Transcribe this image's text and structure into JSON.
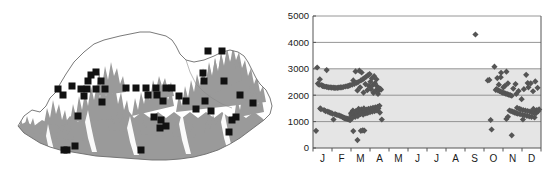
{
  "figure": {
    "panels": [
      "distribution-map",
      "elevation-by-month-scatter"
    ]
  },
  "map": {
    "title": "",
    "region_name": "Bhutan",
    "outline_color": "#6b6b6b",
    "terrain_fill_color": "#9a9a9a",
    "background_color": "#ffffff",
    "marker_symbol": "filled-square",
    "marker_color": "#111111",
    "marker_count": 62,
    "markers": [
      {
        "x": 101,
        "y": 81
      },
      {
        "x": 91,
        "y": 75
      },
      {
        "x": 72,
        "y": 86
      },
      {
        "x": 63,
        "y": 95
      },
      {
        "x": 58,
        "y": 89
      },
      {
        "x": 87,
        "y": 89
      },
      {
        "x": 88,
        "y": 81
      },
      {
        "x": 96,
        "y": 72
      },
      {
        "x": 105,
        "y": 89
      },
      {
        "x": 96,
        "y": 89
      },
      {
        "x": 81,
        "y": 89
      },
      {
        "x": 84,
        "y": 96
      },
      {
        "x": 102,
        "y": 102
      },
      {
        "x": 78,
        "y": 116
      },
      {
        "x": 75,
        "y": 146
      },
      {
        "x": 67,
        "y": 150
      },
      {
        "x": 64,
        "y": 150
      },
      {
        "x": 141,
        "y": 150
      },
      {
        "x": 126,
        "y": 88
      },
      {
        "x": 136,
        "y": 88
      },
      {
        "x": 146,
        "y": 88
      },
      {
        "x": 156,
        "y": 88
      },
      {
        "x": 166,
        "y": 88
      },
      {
        "x": 172,
        "y": 88
      },
      {
        "x": 148,
        "y": 95
      },
      {
        "x": 157,
        "y": 95
      },
      {
        "x": 163,
        "y": 101
      },
      {
        "x": 179,
        "y": 96
      },
      {
        "x": 154,
        "y": 117
      },
      {
        "x": 161,
        "y": 120
      },
      {
        "x": 160,
        "y": 128
      },
      {
        "x": 166,
        "y": 126
      },
      {
        "x": 208,
        "y": 51
      },
      {
        "x": 222,
        "y": 51
      },
      {
        "x": 203,
        "y": 73
      },
      {
        "x": 204,
        "y": 81
      },
      {
        "x": 224,
        "y": 81
      },
      {
        "x": 205,
        "y": 101
      },
      {
        "x": 196,
        "y": 109
      },
      {
        "x": 211,
        "y": 111
      },
      {
        "x": 186,
        "y": 101
      },
      {
        "x": 232,
        "y": 120
      },
      {
        "x": 236,
        "y": 117
      },
      {
        "x": 229,
        "y": 132
      },
      {
        "x": 253,
        "y": 103
      },
      {
        "x": 240,
        "y": 95
      }
    ]
  },
  "chart_data": {
    "type": "scatter",
    "title": "",
    "xlabel": "",
    "ylabel": "",
    "xlim": [
      0,
      12
    ],
    "ylim": [
      0,
      5000
    ],
    "ytick_values": [
      0,
      1000,
      2000,
      3000,
      4000,
      5000
    ],
    "ytick_labels": [
      "0",
      "1000",
      "2000",
      "3000",
      "4000",
      "5000"
    ],
    "xtick_labels": [
      "J",
      "F",
      "M",
      "A",
      "M",
      "J",
      "J",
      "A",
      "S",
      "O",
      "N",
      "D"
    ],
    "xtick_positions": [
      0.5,
      1.5,
      2.5,
      3.5,
      4.5,
      5.5,
      6.5,
      7.5,
      8.5,
      9.5,
      10.5,
      11.5
    ],
    "grid": true,
    "gridline_values": [
      1000,
      2000,
      3000,
      4000,
      5000
    ],
    "gridline_color": "#8a8a8a",
    "shaded_band": {
      "from": 0,
      "to": 3000,
      "fill": "#e8e8e8"
    },
    "marker_symbol": "filled-diamond",
    "marker_color": "#555555",
    "frame_color": "#555555",
    "point_count": 218,
    "points": [
      [
        0.16,
        650
      ],
      [
        0.22,
        3050
      ],
      [
        0.26,
        2440
      ],
      [
        0.3,
        2420
      ],
      [
        0.33,
        2400
      ],
      [
        0.36,
        2600
      ],
      [
        0.38,
        1500
      ],
      [
        0.42,
        1470
      ],
      [
        0.46,
        2380
      ],
      [
        0.5,
        2350
      ],
      [
        0.54,
        2340
      ],
      [
        0.58,
        1440
      ],
      [
        0.62,
        2330
      ],
      [
        0.66,
        1400
      ],
      [
        0.7,
        2320
      ],
      [
        0.72,
        2950
      ],
      [
        0.74,
        2310
      ],
      [
        0.78,
        1380
      ],
      [
        0.82,
        2300
      ],
      [
        0.86,
        1350
      ],
      [
        0.9,
        2300
      ],
      [
        0.94,
        1330
      ],
      [
        0.98,
        2290
      ],
      [
        1.02,
        1300
      ],
      [
        1.06,
        2290
      ],
      [
        1.08,
        1080
      ],
      [
        1.12,
        2280
      ],
      [
        1.16,
        1280
      ],
      [
        1.2,
        2280
      ],
      [
        1.24,
        1260
      ],
      [
        1.28,
        2280
      ],
      [
        1.32,
        1240
      ],
      [
        1.36,
        2290
      ],
      [
        1.4,
        1230
      ],
      [
        1.44,
        2300
      ],
      [
        1.48,
        1200
      ],
      [
        1.52,
        2300
      ],
      [
        1.56,
        1170
      ],
      [
        1.6,
        2310
      ],
      [
        1.62,
        1150
      ],
      [
        1.66,
        1130
      ],
      [
        1.7,
        2330
      ],
      [
        1.72,
        1120
      ],
      [
        1.76,
        1110
      ],
      [
        1.8,
        2340
      ],
      [
        1.82,
        1100
      ],
      [
        1.86,
        1090
      ],
      [
        1.88,
        2350
      ],
      [
        1.9,
        1080
      ],
      [
        1.92,
        1070
      ],
      [
        1.95,
        2380
      ],
      [
        1.97,
        1060
      ],
      [
        2.0,
        1320
      ],
      [
        2.02,
        1250
      ],
      [
        2.04,
        1200
      ],
      [
        2.06,
        2400
      ],
      [
        2.08,
        1150
      ],
      [
        2.1,
        1420
      ],
      [
        2.12,
        2560
      ],
      [
        2.14,
        1350
      ],
      [
        2.16,
        1290
      ],
      [
        2.18,
        2430
      ],
      [
        2.2,
        1230
      ],
      [
        2.22,
        1180
      ],
      [
        2.24,
        2900
      ],
      [
        2.26,
        1400
      ],
      [
        2.28,
        1330
      ],
      [
        2.3,
        2470
      ],
      [
        2.32,
        1270
      ],
      [
        2.34,
        2180
      ],
      [
        2.36,
        1210
      ],
      [
        2.38,
        2500
      ],
      [
        2.4,
        1480
      ],
      [
        2.42,
        1410
      ],
      [
        2.44,
        2930
      ],
      [
        2.46,
        1340
      ],
      [
        2.48,
        2300
      ],
      [
        2.5,
        1280
      ],
      [
        2.52,
        2560
      ],
      [
        2.54,
        1460
      ],
      [
        2.56,
        2860
      ],
      [
        2.58,
        1390
      ],
      [
        2.6,
        1320
      ],
      [
        2.62,
        2600
      ],
      [
        2.64,
        1260
      ],
      [
        2.66,
        2100
      ],
      [
        2.68,
        1500
      ],
      [
        2.7,
        2650
      ],
      [
        2.72,
        1430
      ],
      [
        2.74,
        1370
      ],
      [
        2.76,
        2420
      ],
      [
        2.78,
        1310
      ],
      [
        2.8,
        2700
      ],
      [
        2.82,
        1450
      ],
      [
        2.84,
        1390
      ],
      [
        2.86,
        2190
      ],
      [
        2.88,
        1330
      ],
      [
        2.9,
        2760
      ],
      [
        2.92,
        1480
      ],
      [
        2.94,
        2350
      ],
      [
        2.96,
        1420
      ],
      [
        2.98,
        2800
      ],
      [
        3.0,
        1360
      ],
      [
        3.02,
        2510
      ],
      [
        3.04,
        1500
      ],
      [
        3.06,
        2230
      ],
      [
        3.08,
        1440
      ],
      [
        3.1,
        2640
      ],
      [
        3.12,
        1380
      ],
      [
        3.14,
        2380
      ],
      [
        3.16,
        1520
      ],
      [
        3.18,
        2090
      ],
      [
        3.2,
        1460
      ],
      [
        3.22,
        2720
      ],
      [
        3.24,
        1400
      ],
      [
        3.26,
        2450
      ],
      [
        3.28,
        1540
      ],
      [
        3.3,
        2170
      ],
      [
        3.32,
        1480
      ],
      [
        3.34,
        2600
      ],
      [
        3.36,
        1420
      ],
      [
        3.38,
        2330
      ],
      [
        3.4,
        1560
      ],
      [
        3.42,
        2050
      ],
      [
        3.44,
        1500
      ],
      [
        3.46,
        2270
      ],
      [
        3.48,
        2190
      ],
      [
        3.5,
        1600
      ],
      [
        3.52,
        1340
      ],
      [
        3.54,
        2240
      ],
      [
        3.58,
        2210
      ],
      [
        3.62,
        1080
      ],
      [
        2.12,
        640
      ],
      [
        2.34,
        300
      ],
      [
        2.52,
        650
      ],
      [
        2.7,
        660
      ],
      [
        2.62,
        670
      ],
      [
        8.55,
        4300
      ],
      [
        9.2,
        2560
      ],
      [
        9.35,
        1060
      ],
      [
        9.4,
        700
      ],
      [
        9.55,
        3080
      ],
      [
        9.62,
        2200
      ],
      [
        9.66,
        2230
      ],
      [
        9.7,
        2650
      ],
      [
        9.74,
        2180
      ],
      [
        9.78,
        2400
      ],
      [
        9.82,
        2160
      ],
      [
        9.86,
        2140
      ],
      [
        9.9,
        2850
      ],
      [
        9.94,
        2120
      ],
      [
        9.98,
        2100
      ],
      [
        10.02,
        2300
      ],
      [
        10.06,
        2080
      ],
      [
        10.1,
        2350
      ],
      [
        10.14,
        2060
      ],
      [
        10.18,
        2890
      ],
      [
        10.22,
        2040
      ],
      [
        10.26,
        2450
      ],
      [
        10.3,
        2020
      ],
      [
        10.34,
        1420
      ],
      [
        10.38,
        2000
      ],
      [
        10.42,
        1400
      ],
      [
        10.46,
        1980
      ],
      [
        10.5,
        1380
      ],
      [
        10.54,
        2250
      ],
      [
        10.58,
        1360
      ],
      [
        10.62,
        1340
      ],
      [
        10.66,
        2420
      ],
      [
        10.7,
        1320
      ],
      [
        10.74,
        1520
      ],
      [
        10.78,
        1300
      ],
      [
        10.82,
        2160
      ],
      [
        10.86,
        1480
      ],
      [
        10.9,
        1280
      ],
      [
        10.94,
        1460
      ],
      [
        10.98,
        1850
      ],
      [
        11.02,
        1260
      ],
      [
        11.06,
        1440
      ],
      [
        11.1,
        2230
      ],
      [
        11.14,
        1240
      ],
      [
        11.18,
        1420
      ],
      [
        11.22,
        2770
      ],
      [
        11.26,
        1220
      ],
      [
        11.3,
        1400
      ],
      [
        11.34,
        2300
      ],
      [
        11.38,
        1200
      ],
      [
        11.42,
        1380
      ],
      [
        11.46,
        2450
      ],
      [
        11.5,
        1180
      ],
      [
        11.54,
        1360
      ],
      [
        11.58,
        2150
      ],
      [
        11.62,
        1340
      ],
      [
        11.66,
        1160
      ],
      [
        11.7,
        2520
      ],
      [
        11.74,
        1320
      ],
      [
        11.78,
        1440
      ],
      [
        11.82,
        2280
      ],
      [
        11.86,
        1400
      ],
      [
        11.9,
        1460
      ],
      [
        10.46,
        480
      ],
      [
        10.18,
        1100
      ],
      [
        11.05,
        1080
      ],
      [
        9.28,
        2580
      ],
      [
        10.7,
        2050
      ],
      [
        11.3,
        2460
      ],
      [
        9.88,
        2680
      ],
      [
        10.26,
        1180
      ],
      [
        11.6,
        1480
      ]
    ]
  }
}
